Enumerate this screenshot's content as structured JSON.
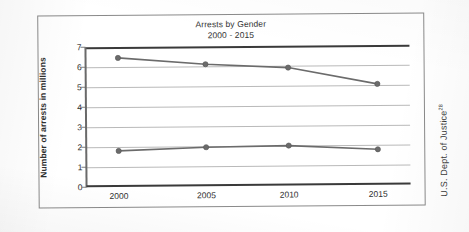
{
  "chart_data": {
    "type": "line",
    "title": "Arrests by Gender",
    "subtitle": "2000 - 2015",
    "xlabel": "",
    "ylabel": "Number of arrests in millions",
    "categories": [
      "2000",
      "2005",
      "2010",
      "2015"
    ],
    "x": [
      2000,
      2005,
      2010,
      2015
    ],
    "ylim": [
      0,
      7
    ],
    "yticks": [
      0,
      1,
      2,
      3,
      4,
      5,
      6,
      7
    ],
    "ytick_labels": [
      "0",
      "1",
      "2",
      "3",
      "4",
      "5",
      "6",
      "7"
    ],
    "grid": true,
    "legend": false,
    "legend_position": "none",
    "series": [
      {
        "name": "Male",
        "values": [
          6.45,
          6.1,
          5.9,
          5.05
        ],
        "color": "#6b6b6b"
      },
      {
        "name": "Female",
        "values": [
          1.8,
          1.95,
          2.0,
          1.78
        ],
        "color": "#6b6b6b"
      }
    ],
    "source": "U.S. Dept. of Justice",
    "source_note": "28"
  },
  "figure": {
    "title_main": "Arrests by Gender",
    "title_sub": "2000 - 2015",
    "y_axis_title": "Number of arrests in millions",
    "source_text": "U.S. Dept. of Justice",
    "source_superscript": "28"
  },
  "colors": {
    "series_line": "#6b6b6b",
    "gridline": "#b9b9b9",
    "axis": "#3a3a3a",
    "frame": "#8a8a8a",
    "text": "#2f2f2f",
    "background": "#ffffff"
  }
}
